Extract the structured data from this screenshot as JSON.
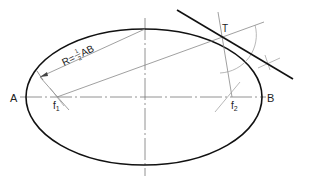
{
  "diagram": {
    "labels": {
      "point_a": "A",
      "point_b": "B",
      "point_t": "T",
      "focus_1": "f",
      "focus_1_sub": "1",
      "focus_2": "f",
      "focus_2_sub": "2",
      "radius_prefix": "R=",
      "radius_num": "1",
      "radius_den": "2",
      "radius_suffix": "AB"
    },
    "colors": {
      "ellipse": "#111111",
      "construction": "#888888",
      "tangent": "#111111",
      "text": "#222222"
    }
  }
}
